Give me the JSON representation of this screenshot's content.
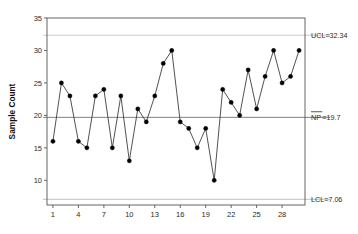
{
  "chart_data": {
    "type": "line",
    "title": "",
    "xlabel": "",
    "ylabel": "Sample Count",
    "x": [
      1,
      2,
      3,
      4,
      5,
      6,
      7,
      8,
      9,
      10,
      11,
      12,
      13,
      14,
      15,
      16,
      17,
      18,
      19,
      20,
      21,
      22,
      23,
      24,
      25,
      26,
      27,
      28,
      29,
      30
    ],
    "values": [
      16,
      25,
      23,
      16,
      15,
      23,
      24,
      15,
      23,
      13,
      21,
      19,
      23,
      28,
      30,
      19,
      18,
      15,
      18,
      10,
      24,
      22,
      20,
      27,
      21,
      26,
      30,
      25,
      26,
      30
    ],
    "series": [
      {
        "name": "Sample Count",
        "values": [
          16,
          25,
          23,
          16,
          15,
          23,
          24,
          15,
          23,
          13,
          21,
          19,
          23,
          28,
          30,
          19,
          18,
          15,
          18,
          10,
          24,
          22,
          20,
          27,
          21,
          26,
          30,
          25,
          26,
          30
        ]
      }
    ],
    "ylim": [
      6.2,
      35
    ],
    "xlim": [
      0.3,
      30.7
    ],
    "yticks": [
      10,
      15,
      20,
      25,
      30,
      35
    ],
    "xticks": [
      1,
      4,
      7,
      10,
      13,
      16,
      19,
      22,
      25,
      28
    ],
    "grid": false,
    "legend": "none",
    "marker": "filled-circle",
    "control_limits": {
      "ucl": {
        "value": 32.34,
        "label": "UCL=32.34"
      },
      "center": {
        "value": 19.7,
        "label": "NP=19.7",
        "symbol": "NP",
        "overbar": true,
        "value_text": "=19.7"
      },
      "lcl": {
        "value": 7.06,
        "label": "LCL=7.06"
      }
    },
    "colors": {
      "series_line": "#333333",
      "marker": "#000000",
      "center_line": "#808080",
      "limit_line": "#cccccc",
      "axis": "#555555",
      "background": "#ffffff",
      "text": "#2b2b2b"
    }
  }
}
